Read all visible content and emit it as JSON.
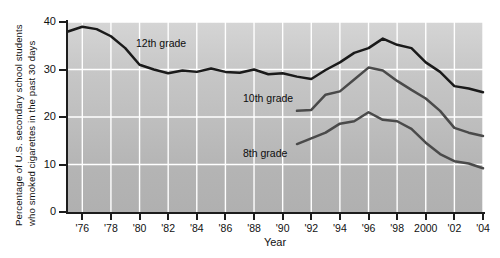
{
  "chart_data": {
    "type": "line",
    "title": "",
    "xlabel": "Year",
    "ylabel": "Percentage of U.S. secondary school students who smoked cigarettes in the past 30 days",
    "ylabel_lines": [
      "Percentage of U.S. secondary school students",
      "who smoked cigarettes in the past 30 days"
    ],
    "xlim": [
      1975,
      2004
    ],
    "ylim": [
      0,
      40
    ],
    "yticks": [
      0,
      10,
      20,
      30,
      40
    ],
    "ytick_labels": [
      "0",
      "10",
      "20",
      "30",
      "40"
    ],
    "xticks": [
      1976,
      1978,
      1980,
      1982,
      1984,
      1986,
      1988,
      1990,
      1992,
      1994,
      1996,
      1998,
      2000,
      2002,
      2004
    ],
    "xtick_labels": [
      "'76",
      "'78",
      "'80",
      "'82",
      "'84",
      "'86",
      "'88",
      "'90",
      "'92",
      "'94",
      "'96",
      "'98",
      "2000",
      "'02",
      "'04"
    ],
    "grid": true,
    "grid_color": "#ffffff",
    "plot_background": "#c0c0c0",
    "legend_position": "inline-annotations",
    "series": [
      {
        "name": "12th grade",
        "label": "12th grade",
        "color": "#1a1a1a",
        "x": [
          1975,
          1976,
          1977,
          1978,
          1979,
          1980,
          1981,
          1982,
          1983,
          1984,
          1985,
          1986,
          1987,
          1988,
          1989,
          1990,
          1991,
          1992,
          1993,
          1994,
          1995,
          1996,
          1997,
          1998,
          1999,
          2000,
          2001,
          2002,
          2003,
          2004
        ],
        "values": [
          38.0,
          39.0,
          38.5,
          37.0,
          34.5,
          31.0,
          30.0,
          29.2,
          29.8,
          29.5,
          30.2,
          29.5,
          29.3,
          30.0,
          29.0,
          29.2,
          28.5,
          28.0,
          29.9,
          31.5,
          33.5,
          34.5,
          36.5,
          35.2,
          34.5,
          31.5,
          29.5,
          26.5,
          26.0,
          25.2
        ],
        "marker": "none",
        "linewidth": 2.5
      },
      {
        "name": "10th grade",
        "label": "10th grade",
        "color": "#4a4a4a",
        "x": [
          1991,
          1992,
          1993,
          1994,
          1995,
          1996,
          1997,
          1998,
          1999,
          2000,
          2001,
          2002,
          2003,
          2004
        ],
        "values": [
          21.3,
          21.5,
          24.7,
          25.4,
          27.9,
          30.4,
          29.8,
          27.6,
          25.7,
          23.9,
          21.3,
          17.7,
          16.7,
          16.0
        ],
        "marker": "none",
        "linewidth": 2.5
      },
      {
        "name": "8th grade",
        "label": "8th grade",
        "color": "#4a4a4a",
        "x": [
          1991,
          1992,
          1993,
          1994,
          1995,
          1996,
          1997,
          1998,
          1999,
          2000,
          2001,
          2002,
          2003,
          2004
        ],
        "values": [
          14.3,
          15.5,
          16.7,
          18.6,
          19.1,
          21.0,
          19.4,
          19.1,
          17.5,
          14.6,
          12.2,
          10.7,
          10.2,
          9.2
        ],
        "marker": "none",
        "linewidth": 2.5
      }
    ]
  }
}
